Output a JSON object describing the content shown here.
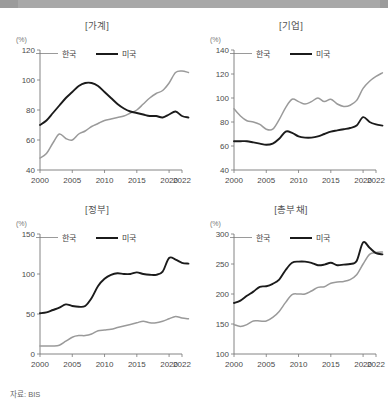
{
  "source_note": "자료: BIS",
  "legend": {
    "korea": "한국",
    "usa": "미국"
  },
  "unit": "(%)",
  "chart_data": [
    {
      "type": "line",
      "title": "[가계]",
      "ylabel": "(%)",
      "xlabel": "",
      "ylim": [
        40,
        120
      ],
      "yticks": [
        40,
        60,
        80,
        100,
        120
      ],
      "xlim": [
        2000,
        2022
      ],
      "xticks": [
        2000,
        2005,
        2010,
        2015,
        2020,
        2022
      ],
      "grid": false,
      "legend_position": "top-left",
      "x": [
        2000,
        2001,
        2002,
        2003,
        2004,
        2005,
        2006,
        2007,
        2008,
        2009,
        2010,
        2011,
        2012,
        2013,
        2014,
        2015,
        2016,
        2017,
        2018,
        2019,
        2020,
        2021,
        2022,
        2023
      ],
      "series": [
        {
          "name": "한국",
          "color": "#9a9a9a",
          "values": [
            48,
            51,
            58,
            64,
            61,
            60,
            64,
            66,
            69,
            71,
            73,
            74,
            75,
            76,
            78,
            80,
            84,
            88,
            91,
            93,
            98,
            105,
            106,
            105
          ]
        },
        {
          "name": "미국",
          "color": "#1b1b1b",
          "values": [
            70,
            73,
            78,
            83,
            88,
            92,
            96,
            98,
            98,
            96,
            92,
            88,
            84,
            81,
            79,
            78,
            77,
            76,
            76,
            75,
            77,
            79,
            76,
            75
          ]
        }
      ]
    },
    {
      "type": "line",
      "title": "[기업]",
      "ylabel": "(%)",
      "xlabel": "",
      "ylim": [
        40,
        140
      ],
      "yticks": [
        40,
        60,
        80,
        100,
        120,
        140
      ],
      "xlim": [
        2000,
        2022
      ],
      "xticks": [
        2000,
        2005,
        2010,
        2015,
        2020,
        2022
      ],
      "grid": false,
      "legend_position": "top-left",
      "x": [
        2000,
        2001,
        2002,
        2003,
        2004,
        2005,
        2006,
        2007,
        2008,
        2009,
        2010,
        2011,
        2012,
        2013,
        2014,
        2015,
        2016,
        2017,
        2018,
        2019,
        2020,
        2021,
        2022,
        2023
      ],
      "series": [
        {
          "name": "한국",
          "color": "#9a9a9a",
          "values": [
            91,
            85,
            81,
            80,
            78,
            74,
            74,
            82,
            92,
            99,
            97,
            95,
            97,
            100,
            97,
            99,
            95,
            93,
            94,
            98,
            108,
            114,
            118,
            121
          ]
        },
        {
          "name": "미국",
          "color": "#1b1b1b",
          "values": [
            64,
            64,
            64,
            63,
            62,
            61,
            62,
            66,
            72,
            71,
            68,
            67,
            67,
            68,
            70,
            72,
            73,
            74,
            75,
            77,
            84,
            80,
            78,
            77
          ]
        }
      ]
    },
    {
      "type": "line",
      "title": "[정부]",
      "ylabel": "(%)",
      "xlabel": "",
      "ylim": [
        0,
        150
      ],
      "yticks": [
        0,
        50,
        100,
        150
      ],
      "xlim": [
        2000,
        2022
      ],
      "xticks": [
        2000,
        2005,
        2010,
        2015,
        2020,
        2022
      ],
      "grid": false,
      "legend_position": "top-left",
      "x": [
        2000,
        2001,
        2002,
        2003,
        2004,
        2005,
        2006,
        2007,
        2008,
        2009,
        2010,
        2011,
        2012,
        2013,
        2014,
        2015,
        2016,
        2017,
        2018,
        2019,
        2020,
        2021,
        2022,
        2023
      ],
      "series": [
        {
          "name": "한국",
          "color": "#9a9a9a",
          "values": [
            10,
            10,
            10,
            11,
            16,
            21,
            23,
            23,
            25,
            29,
            30,
            31,
            33,
            35,
            37,
            39,
            41,
            39,
            39,
            41,
            44,
            47,
            45,
            44
          ]
        },
        {
          "name": "미국",
          "color": "#1b1b1b",
          "values": [
            51,
            52,
            55,
            58,
            62,
            60,
            59,
            60,
            70,
            85,
            94,
            99,
            101,
            100,
            100,
            102,
            100,
            99,
            99,
            103,
            120,
            118,
            114,
            113
          ]
        }
      ]
    },
    {
      "type": "line",
      "title": "[총부채]",
      "ylabel": "(%)",
      "xlabel": "",
      "ylim": [
        100,
        300
      ],
      "yticks": [
        100,
        150,
        200,
        250,
        300
      ],
      "xlim": [
        2000,
        2022
      ],
      "xticks": [
        2000,
        2005,
        2010,
        2015,
        2020,
        2022
      ],
      "grid": false,
      "legend_position": "top-left",
      "x": [
        2000,
        2001,
        2002,
        2003,
        2004,
        2005,
        2006,
        2007,
        2008,
        2009,
        2010,
        2011,
        2012,
        2013,
        2014,
        2015,
        2016,
        2017,
        2018,
        2019,
        2020,
        2021,
        2022,
        2023
      ],
      "series": [
        {
          "name": "한국",
          "color": "#9a9a9a",
          "values": [
            149,
            146,
            149,
            155,
            155,
            155,
            161,
            171,
            186,
            199,
            200,
            200,
            205,
            211,
            212,
            218,
            220,
            221,
            224,
            232,
            250,
            266,
            269,
            270
          ]
        },
        {
          "name": "미국",
          "color": "#1b1b1b",
          "values": [
            185,
            189,
            197,
            204,
            212,
            213,
            217,
            224,
            240,
            252,
            254,
            254,
            252,
            248,
            249,
            252,
            248,
            249,
            250,
            255,
            286,
            277,
            268,
            266
          ]
        }
      ]
    }
  ]
}
